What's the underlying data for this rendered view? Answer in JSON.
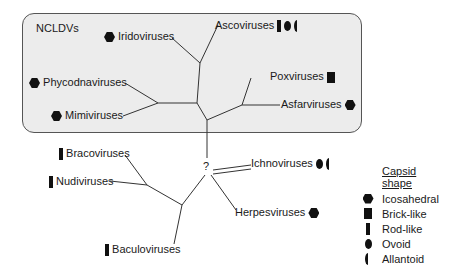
{
  "group": {
    "label": "NCLDVs"
  },
  "taxa": {
    "iridoviruses": {
      "name": "Iridoviruses",
      "shapes": [
        "icosahedral"
      ]
    },
    "ascoviruses": {
      "name": "Ascoviruses",
      "shapes": [
        "rod-like",
        "ovoid",
        "allantoid"
      ]
    },
    "phycodnaviruses": {
      "name": "Phycodnaviruses",
      "shapes": [
        "icosahedral"
      ]
    },
    "mimiviruses": {
      "name": "Mimiviruses",
      "shapes": [
        "icosahedral"
      ]
    },
    "poxviruses": {
      "name": "Poxviruses",
      "shapes": [
        "brick-like"
      ]
    },
    "asfarviruses": {
      "name": "Asfarviruses",
      "shapes": [
        "icosahedral"
      ]
    },
    "bracoviruses": {
      "name": "Bracoviruses",
      "shapes": [
        "rod-like"
      ]
    },
    "nudiviruses": {
      "name": "Nudiviruses",
      "shapes": [
        "rod-like"
      ]
    },
    "ichnoviruses": {
      "name": "Ichnoviruses",
      "shapes": [
        "ovoid",
        "allantoid"
      ]
    },
    "herpesviruses": {
      "name": "Herpesviruses",
      "shapes": [
        "icosahedral"
      ]
    },
    "baculoviruses": {
      "name": "Baculoviruses",
      "shapes": [
        "rod-like"
      ]
    }
  },
  "unknown_node": "?",
  "legend": {
    "title": "Capsid shape",
    "items": [
      {
        "shape": "icosahedral",
        "label": "Icosahedral"
      },
      {
        "shape": "brick-like",
        "label": "Brick-like"
      },
      {
        "shape": "rod-like",
        "label": "Rod-like"
      },
      {
        "shape": "ovoid",
        "label": "Ovoid"
      },
      {
        "shape": "allantoid",
        "label": "Allantoid"
      }
    ]
  }
}
